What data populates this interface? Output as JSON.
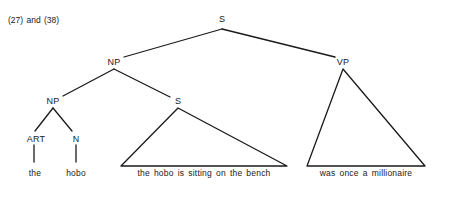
{
  "caption": "(27) and (38)",
  "tree": {
    "root": {
      "label": "S"
    },
    "np_upper": {
      "label": "NP"
    },
    "vp": {
      "label": "VP"
    },
    "np_lower": {
      "label": "NP"
    },
    "s_lower": {
      "label": "S"
    },
    "art": {
      "label": "ART"
    },
    "n": {
      "label": "N"
    },
    "leaves": {
      "art_word": "the",
      "n_word": "hobo",
      "s_phrase": "the hobo is sitting on the bench",
      "vp_phrase": "was once a millionaire"
    }
  },
  "colors": {
    "line": "#1a1a1a",
    "background": "#ffffff"
  }
}
